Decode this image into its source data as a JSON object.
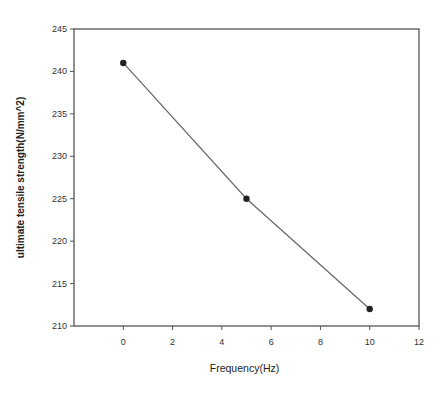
{
  "chart_data": {
    "type": "line",
    "title": "",
    "xlabel": "Frequency(Hz)",
    "ylabel": "ultimate tensile strength(N/mm^2)",
    "x": [
      0,
      5,
      10
    ],
    "series": [
      {
        "name": "ultimate tensile strength",
        "values": [
          241,
          225,
          212
        ]
      }
    ],
    "xlim": [
      -2,
      12
    ],
    "ylim": [
      210,
      245
    ],
    "xticks": [
      0,
      2,
      4,
      6,
      8,
      10,
      12
    ],
    "yticks": [
      210,
      215,
      220,
      225,
      230,
      235,
      240,
      245
    ],
    "grid": false,
    "legend": "none",
    "marker": "filled-circle",
    "line_color": "#666666",
    "marker_color": "#222222"
  },
  "layout": {
    "plot_left": 74,
    "plot_top": 29,
    "plot_right": 419,
    "plot_bottom": 326
  }
}
